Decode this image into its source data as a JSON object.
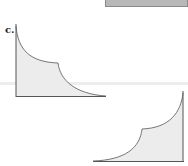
{
  "figure": {
    "label": "c.",
    "diagrams": [
      {
        "name": "decreasing-curve-graph",
        "description": "shaded area under a decreasing two-segment curve"
      },
      {
        "name": "increasing-curve-graph",
        "description": "shaded area under an increasing two-segment curve (mirror image)"
      }
    ],
    "colors": {
      "fill": "#ececec",
      "line": "#555555",
      "header_box": "#b8b8b8"
    }
  }
}
